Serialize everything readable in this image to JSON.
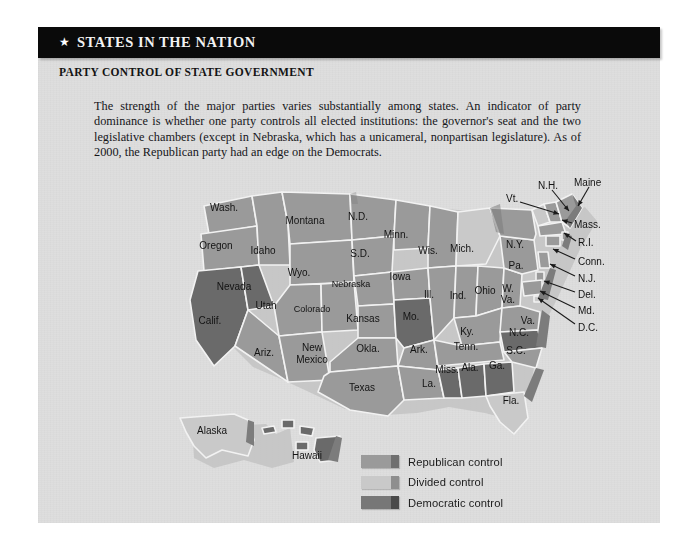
{
  "header": {
    "star_icon": "star-icon",
    "title": "STATES IN THE NATION"
  },
  "subtitle": "PARTY CONTROL OF STATE GOVERNMENT",
  "paragraph": "The strength of the major parties varies substantially among states. An indicator of party dominance is whether one party controls all elected institutions: the governor's seat and the two legislative chambers (except in Nebraska, which has a unicameral, nonpartisan legislature). As of 2000, the Republican party had an edge on the Democrats.",
  "colors": {
    "panel_background": "#dedede",
    "header_bar": "#0a0a0a",
    "republican": "#9a9a9a",
    "divided": "#c9c9c9",
    "democratic": "#6a6a6a",
    "state_border": "#f2f2f2",
    "shadow": "#bdbdbd",
    "text": "#141414"
  },
  "legend": {
    "title": "",
    "items": [
      {
        "label": "Republican control",
        "key": "republican",
        "fill": "#9a9a9a",
        "edge": "#6f6f6f"
      },
      {
        "label": "Divided control",
        "key": "divided",
        "fill": "#c9c9c9",
        "edge": "#8e8e8e"
      },
      {
        "label": "Democratic control",
        "key": "democratic",
        "fill": "#777777",
        "edge": "#4a4a4a"
      }
    ]
  },
  "map": {
    "title": "Party control of state government, 2000",
    "states": [
      {
        "label": "Wash.",
        "control": "republican",
        "lx": 186,
        "ly": 41
      },
      {
        "label": "Oregon",
        "control": "republican",
        "lx": 178,
        "ly": 79
      },
      {
        "label": "Calif.",
        "control": "democratic",
        "lx": 172,
        "ly": 154
      },
      {
        "label": "Nevada",
        "control": "democratic",
        "lx": 196,
        "ly": 120
      },
      {
        "label": "Idaho",
        "control": "republican",
        "lx": 225,
        "ly": 84
      },
      {
        "label": "Montana",
        "control": "republican",
        "lx": 267,
        "ly": 54
      },
      {
        "label": "Wyo.",
        "control": "republican",
        "lx": 261,
        "ly": 106
      },
      {
        "label": "Utah",
        "control": "republican",
        "lx": 228,
        "ly": 139
      },
      {
        "label": "Ariz.",
        "control": "republican",
        "lx": 226,
        "ly": 186
      },
      {
        "label": "Colorado",
        "control": "republican",
        "lx": 274,
        "ly": 142
      },
      {
        "label": "New",
        "control": "republican",
        "lx": 274,
        "ly": 181
      },
      {
        "label": "Mexico",
        "control": "republican",
        "lx": 274,
        "ly": 193
      },
      {
        "label": "N.D.",
        "control": "republican",
        "lx": 320,
        "ly": 50
      },
      {
        "label": "S.D.",
        "control": "republican",
        "lx": 322,
        "ly": 87
      },
      {
        "label": "Nebraska",
        "control": "republican",
        "lx": 313,
        "ly": 117
      },
      {
        "label": "Kansas",
        "control": "republican",
        "lx": 325,
        "ly": 152
      },
      {
        "label": "Okla.",
        "control": "republican",
        "lx": 330,
        "ly": 182
      },
      {
        "label": "Texas",
        "control": "republican",
        "lx": 324,
        "ly": 221
      },
      {
        "label": "Minn.",
        "control": "republican",
        "lx": 358,
        "ly": 68
      },
      {
        "label": "Iowa",
        "control": "republican",
        "lx": 362,
        "ly": 110
      },
      {
        "label": "Mo.",
        "control": "democratic",
        "lx": 373,
        "ly": 150
      },
      {
        "label": "Ark.",
        "control": "republican",
        "lx": 381,
        "ly": 183
      },
      {
        "label": "La.",
        "control": "republican",
        "lx": 391,
        "ly": 217
      },
      {
        "label": "Wis.",
        "control": "republican",
        "lx": 390,
        "ly": 84
      },
      {
        "label": "Ill.",
        "control": "republican",
        "lx": 391,
        "ly": 128
      },
      {
        "label": "Miss.",
        "control": "democratic",
        "lx": 409,
        "ly": 203
      },
      {
        "label": "Mich.",
        "control": "divided",
        "lx": 424,
        "ly": 82
      },
      {
        "label": "Ind.",
        "control": "republican",
        "lx": 420,
        "ly": 129
      },
      {
        "label": "Ky.",
        "control": "republican",
        "lx": 429,
        "ly": 165
      },
      {
        "label": "Tenn.",
        "control": "republican",
        "lx": 428,
        "ly": 180
      },
      {
        "label": "Ala.",
        "control": "democratic",
        "lx": 432,
        "ly": 201
      },
      {
        "label": "Ohio",
        "control": "republican",
        "lx": 447,
        "ly": 124
      },
      {
        "label": "W.",
        "control": "republican",
        "lx": 470,
        "ly": 122
      },
      {
        "label": "Va.",
        "control": "republican",
        "lx": 470,
        "ly": 133
      },
      {
        "label": "Ga.",
        "control": "democratic",
        "lx": 459,
        "ly": 199
      },
      {
        "label": "Pa.",
        "control": "republican",
        "lx": 478,
        "ly": 99
      },
      {
        "label": "Va.",
        "control": "republican",
        "lx": 490,
        "ly": 154
      },
      {
        "label": "N.C.",
        "control": "democratic",
        "lx": 481,
        "ly": 166
      },
      {
        "label": "S.C.",
        "control": "republican",
        "lx": 478,
        "ly": 184
      },
      {
        "label": "Fla.",
        "control": "divided",
        "lx": 473,
        "ly": 234
      },
      {
        "label": "N.Y.",
        "control": "republican",
        "lx": 477,
        "ly": 78
      },
      {
        "label": "Alaska",
        "control": "divided",
        "lx": 174,
        "ly": 264
      },
      {
        "label": "Hawaii",
        "control": "democratic",
        "lx": 269,
        "ly": 289
      }
    ],
    "callouts": [
      {
        "label": "N.H.",
        "control": "republican",
        "tx": 500,
        "ty": 15,
        "x1": 514,
        "y1": 20,
        "x2": 531,
        "y2": 41
      },
      {
        "label": "Maine",
        "control": "republican",
        "tx": 536,
        "ty": 12,
        "x1": 551,
        "y1": 17,
        "x2": 540,
        "y2": 36
      },
      {
        "label": "Vt.",
        "control": "divided",
        "tx": 468,
        "ty": 28,
        "x1": 482,
        "y1": 32,
        "x2": 521,
        "y2": 44
      },
      {
        "label": "Mass.",
        "control": "republican",
        "tx": 536,
        "ty": 54,
        "x1": 534,
        "y1": 53,
        "x2": 524,
        "y2": 50
      },
      {
        "label": "R.I.",
        "control": "republican",
        "tx": 540,
        "ty": 72,
        "x1": 538,
        "y1": 71,
        "x2": 526,
        "y2": 63
      },
      {
        "label": "Conn.",
        "control": "republican",
        "tx": 540,
        "ty": 91,
        "x1": 537,
        "y1": 89,
        "x2": 515,
        "y2": 79
      },
      {
        "label": "N.J.",
        "control": "republican",
        "tx": 540,
        "ty": 108,
        "x1": 537,
        "y1": 106,
        "x2": 512,
        "y2": 94
      },
      {
        "label": "Del.",
        "control": "republican",
        "tx": 540,
        "ty": 124,
        "x1": 537,
        "y1": 122,
        "x2": 506,
        "y2": 111
      },
      {
        "label": "Md.",
        "control": "republican",
        "tx": 540,
        "ty": 140,
        "x1": 537,
        "y1": 138,
        "x2": 502,
        "y2": 121
      },
      {
        "label": "D.C.",
        "control": "divided",
        "tx": 540,
        "ty": 157,
        "x1": 537,
        "y1": 154,
        "x2": 500,
        "y2": 128
      }
    ]
  }
}
